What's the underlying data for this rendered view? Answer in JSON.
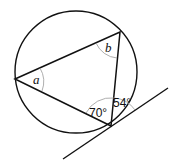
{
  "diagram": {
    "circle": {
      "cx": 76,
      "cy": 72,
      "r": 61,
      "stroke": "#111111"
    },
    "vertices": {
      "left": {
        "x": 15,
        "y": 79
      },
      "top": {
        "x": 120,
        "y": 32
      },
      "bottom": {
        "x": 111,
        "y": 126
      }
    },
    "tangent": {
      "x1": 63,
      "y1": 159,
      "x2": 168,
      "y2": 88
    },
    "labels": {
      "angle_a": "a",
      "angle_b": "b",
      "angle_70": "70°",
      "angle_54": "54°"
    },
    "colors": {
      "line": "#111111",
      "arc": "#999999"
    }
  }
}
